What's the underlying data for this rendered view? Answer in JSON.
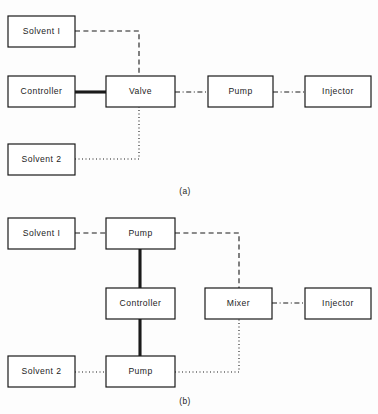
{
  "figure": {
    "panels": [
      {
        "id": "a",
        "caption": "(a)",
        "boxes": [
          {
            "key": "solvent1",
            "label": "Solvent I",
            "x": 8,
            "y": 16,
            "w": 67,
            "h": 31
          },
          {
            "key": "controller",
            "label": "Controller",
            "x": 8,
            "y": 76,
            "w": 67,
            "h": 31
          },
          {
            "key": "valve",
            "label": "Valve",
            "x": 106,
            "y": 76,
            "w": 69,
            "h": 31
          },
          {
            "key": "pump",
            "label": "Pump",
            "x": 208,
            "y": 76,
            "w": 65,
            "h": 31
          },
          {
            "key": "injector",
            "label": "Injector",
            "x": 305,
            "y": 76,
            "w": 66,
            "h": 31
          },
          {
            "key": "solvent2",
            "label": "Solvent 2",
            "x": 8,
            "y": 144,
            "w": 67,
            "h": 31
          }
        ],
        "connections": [
          {
            "key": "solvent1-to-valve",
            "style": "dashed",
            "points": "75,31 139,31 139,76"
          },
          {
            "key": "solvent2-to-valve",
            "style": "dotted",
            "points": "75,159 139,159 139,107"
          },
          {
            "key": "controller-to-valve",
            "style": "thick",
            "points": "75,92 106,92"
          },
          {
            "key": "valve-to-pump",
            "style": "dashdot",
            "points": "175,92 208,92"
          },
          {
            "key": "pump-to-injector",
            "style": "dashdot",
            "points": "273,92 305,92"
          }
        ]
      },
      {
        "id": "b",
        "caption": "(b)",
        "boxes": [
          {
            "key": "solvent1",
            "label": "Solvent I",
            "x": 8,
            "y": 218,
            "w": 67,
            "h": 31
          },
          {
            "key": "pump-top",
            "label": "Pump",
            "x": 106,
            "y": 218,
            "w": 69,
            "h": 31
          },
          {
            "key": "controller",
            "label": "Controller",
            "x": 106,
            "y": 288,
            "w": 69,
            "h": 31
          },
          {
            "key": "mixer",
            "label": "Mixer",
            "x": 205,
            "y": 288,
            "w": 67,
            "h": 31
          },
          {
            "key": "injector",
            "label": "Injector",
            "x": 305,
            "y": 288,
            "w": 66,
            "h": 31
          },
          {
            "key": "solvent2",
            "label": "Solvent 2",
            "x": 8,
            "y": 356,
            "w": 67,
            "h": 31
          },
          {
            "key": "pump-bottom",
            "label": "Pump",
            "x": 106,
            "y": 356,
            "w": 69,
            "h": 31
          }
        ],
        "connections": [
          {
            "key": "solvent1-to-pump-top",
            "style": "dashed",
            "points": "75,233 106,233"
          },
          {
            "key": "pump-top-to-mixer",
            "style": "dashed",
            "points": "175,233 239,233 239,288"
          },
          {
            "key": "pump-top-to-controller",
            "style": "thick",
            "points": "140,249 140,288"
          },
          {
            "key": "controller-to-pump-bottom",
            "style": "thick",
            "points": "140,319 140,356"
          },
          {
            "key": "solvent2-to-pump-bottom",
            "style": "dotted",
            "points": "75,372 106,372"
          },
          {
            "key": "pump-bottom-to-mixer",
            "style": "dotted",
            "points": "175,372 239,372 239,319"
          },
          {
            "key": "mixer-to-injector",
            "style": "dashdot",
            "points": "272,303 305,303"
          }
        ]
      }
    ]
  },
  "colors": {
    "stroke": "#1a1a1a",
    "box_fill": "#ffffff",
    "background": "#fdfdfd",
    "text": "#1c1c1c"
  }
}
